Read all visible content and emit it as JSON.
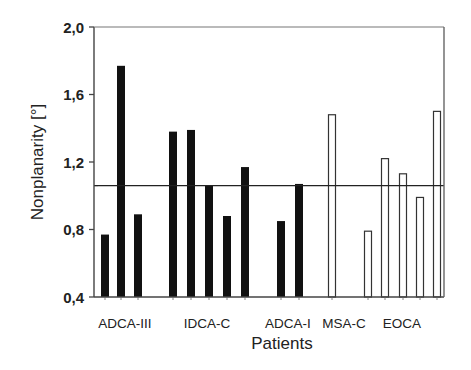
{
  "chart_data": {
    "type": "bar",
    "title": "",
    "xlabel": "Patients",
    "ylabel": "Nonplanarity [°]",
    "ylim": [
      0.4,
      2.0
    ],
    "yticks": [
      0.4,
      0.8,
      1.2,
      1.6,
      2.0
    ],
    "ytick_labels": [
      "0,4",
      "0,8",
      "1,2",
      "1,6",
      "2,0"
    ],
    "grid": false,
    "legend": null,
    "reference_line": {
      "y": 1.06,
      "color": "#222222"
    },
    "groups": [
      {
        "name": "ADCA-III",
        "fill": "filled",
        "values": [
          0.77,
          1.77,
          0.89
        ]
      },
      {
        "name": "IDCA-C",
        "fill": "filled",
        "values": [
          1.38,
          1.39,
          1.06,
          0.88,
          1.17
        ]
      },
      {
        "name": "ADCA-I",
        "fill": "filled",
        "values": [
          0.85,
          1.07
        ]
      },
      {
        "name": "MSA-C",
        "fill": "open",
        "values": [
          1.48
        ]
      },
      {
        "name": "EOCA",
        "fill": "open",
        "values": [
          0.79,
          1.22,
          1.13,
          0.99,
          1.5
        ]
      }
    ],
    "bars": [
      {
        "group": "ADCA-III",
        "x": 101,
        "value": 0.77,
        "open": false
      },
      {
        "group": "ADCA-III",
        "x": 117,
        "value": 1.77,
        "open": false
      },
      {
        "group": "ADCA-III",
        "x": 134,
        "value": 0.89,
        "open": false
      },
      {
        "group": "IDCA-C",
        "x": 169,
        "value": 1.38,
        "open": false
      },
      {
        "group": "IDCA-C",
        "x": 187,
        "value": 1.39,
        "open": false
      },
      {
        "group": "IDCA-C",
        "x": 205,
        "value": 1.06,
        "open": false
      },
      {
        "group": "IDCA-C",
        "x": 223,
        "value": 0.88,
        "open": false
      },
      {
        "group": "IDCA-C",
        "x": 241,
        "value": 1.17,
        "open": false
      },
      {
        "group": "ADCA-I",
        "x": 277,
        "value": 0.85,
        "open": false
      },
      {
        "group": "ADCA-I",
        "x": 295,
        "value": 1.07,
        "open": false
      },
      {
        "group": "MSA-C",
        "x": 328,
        "value": 1.48,
        "open": true
      },
      {
        "group": "EOCA",
        "x": 364,
        "value": 0.79,
        "open": true
      },
      {
        "group": "EOCA",
        "x": 381,
        "value": 1.22,
        "open": true
      },
      {
        "group": "EOCA",
        "x": 399,
        "value": 1.13,
        "open": true
      },
      {
        "group": "EOCA",
        "x": 416,
        "value": 0.99,
        "open": true
      },
      {
        "group": "EOCA",
        "x": 433,
        "value": 1.5,
        "open": true
      }
    ],
    "category_labels": [
      {
        "text": "ADCA-III",
        "x": 125
      },
      {
        "text": "IDCA-C",
        "x": 207
      },
      {
        "text": "ADCA-I",
        "x": 288
      },
      {
        "text": "MSA-C",
        "x": 344
      },
      {
        "text": "EOCA",
        "x": 402
      }
    ],
    "colors": {
      "filled": "#111111",
      "open_fill": "#ffffff",
      "stroke": "#333333",
      "axis": "#444444"
    }
  }
}
